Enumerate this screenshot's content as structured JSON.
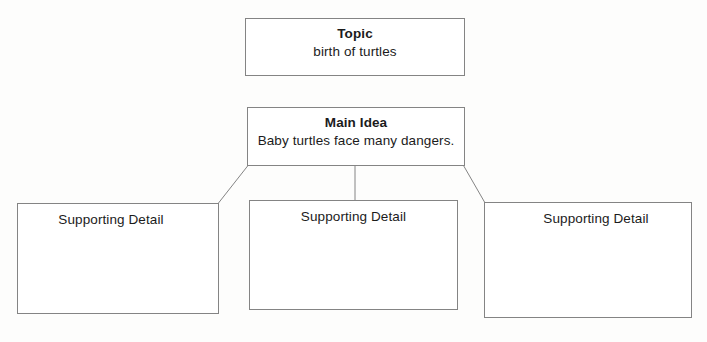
{
  "diagram": {
    "type": "main-idea-graphic-organizer",
    "line_color": "#848484",
    "text_color": "#1b1b1b",
    "background_color": "#fdfdfc",
    "topic": {
      "heading": "Topic",
      "body": "birth of turtles"
    },
    "main_idea": {
      "heading": "Main Idea",
      "body": "Baby turtles face many dangers."
    },
    "supporting_details": [
      {
        "label": "Supporting Detail",
        "body": ""
      },
      {
        "label": "Supporting Detail",
        "body": ""
      },
      {
        "label": "Supporting Detail",
        "body": ""
      }
    ]
  }
}
